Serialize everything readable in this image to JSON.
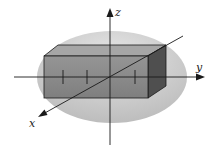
{
  "figure": {
    "axes": {
      "x": {
        "label": "x"
      },
      "y": {
        "label": "y"
      },
      "z": {
        "label": "z"
      }
    },
    "colors": {
      "ellipsoid_fill": "#c4c4c4",
      "ellipsoid_highlight": "#e6e6e6",
      "box_front": "#8a8a8a",
      "box_top": "#a3a3a3",
      "box_side": "#4e4e4e",
      "lines": "#1a1a1a"
    }
  }
}
